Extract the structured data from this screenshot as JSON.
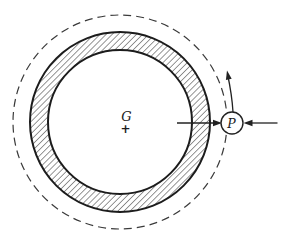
{
  "figure": {
    "background_color": "#ffffff",
    "line_color": "#222222",
    "hatch_color": "#2d2d2d",
    "center_label": "G",
    "center_marker": "+",
    "particle_label": "P",
    "elements": {
      "dashed_circle": "circular-path",
      "hatched_ring": "hoop-cross-section",
      "left_arrow": "arrow-pointing-right-at-P",
      "right_arrow": "arrow-pointing-left-at-P",
      "curved_arrow": "tangential-direction-arrow-counterclockwise"
    }
  }
}
